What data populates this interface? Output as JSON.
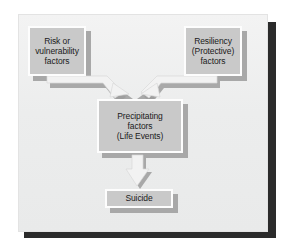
{
  "diagram": {
    "background_color": "#ececec",
    "node_fill_color": "#c9c9c9",
    "node_border_color": "#fdfdfd",
    "node_shadow_color": "#a8a8a8",
    "arrow_fill_color": "#f0f0f0",
    "arrow_shadow_color": "#9c9c9c",
    "frame_shadow_color": "#2b2b2b",
    "text_color": "#1b1b1b",
    "nodes": [
      {
        "id": "risk",
        "name": "risk-or-vulnerability-factors",
        "lines": [
          "Risk or",
          "vulnerability",
          "factors"
        ]
      },
      {
        "id": "resiliency",
        "name": "resiliency-protective-factors",
        "lines": [
          "Resiliency",
          "(Protective)",
          "factors"
        ]
      },
      {
        "id": "precipitating",
        "name": "precipitating-factors-life-events",
        "lines": [
          "Precipitating",
          "factors",
          "(Life Events)"
        ]
      },
      {
        "id": "suicide",
        "name": "suicide",
        "lines": [
          "Suicide"
        ]
      }
    ],
    "connectors": [
      {
        "name": "arrow-risk-to-precipitating",
        "from": "risk",
        "to": "precipitating",
        "style": "elbow-diagonal-right-down"
      },
      {
        "name": "arrow-resiliency-to-precipitating",
        "from": "resiliency",
        "to": "precipitating",
        "style": "elbow-diagonal-left-down"
      },
      {
        "name": "arrow-precipitating-to-suicide",
        "from": "precipitating",
        "to": "suicide",
        "style": "straight-down"
      }
    ]
  }
}
